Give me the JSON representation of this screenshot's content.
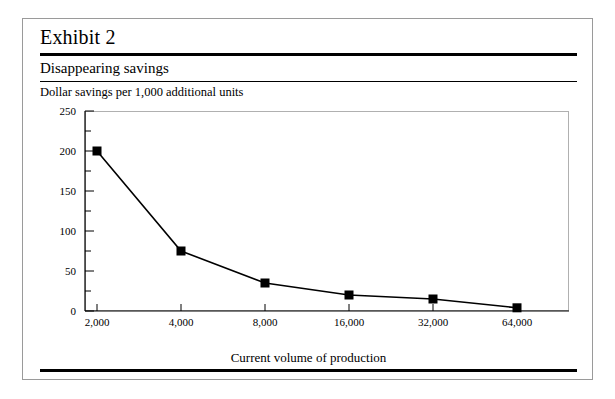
{
  "exhibit": {
    "title": "Exhibit 2",
    "subtitle": "Disappearing savings"
  },
  "chart_data": {
    "type": "line",
    "title": "Disappearing savings",
    "ylabel": "Dollar savings per 1,000 additional units",
    "xlabel": "Current volume of production",
    "categories": [
      "2,000",
      "4,000",
      "8,000",
      "16,000",
      "32,000",
      "64,000"
    ],
    "x_values": [
      2000,
      4000,
      8000,
      16000,
      32000,
      64000
    ],
    "x_scale": "log2",
    "values": [
      200,
      75,
      35,
      20,
      15,
      4
    ],
    "ylim": [
      0,
      250
    ],
    "y_major_ticks": [
      0,
      50,
      100,
      150,
      200,
      250
    ],
    "y_minor_ticks": [
      25,
      75,
      125,
      175,
      225
    ],
    "grid": false,
    "legend": "none",
    "marker": "filled-square",
    "line_color": "#000000",
    "marker_color": "#000000"
  }
}
